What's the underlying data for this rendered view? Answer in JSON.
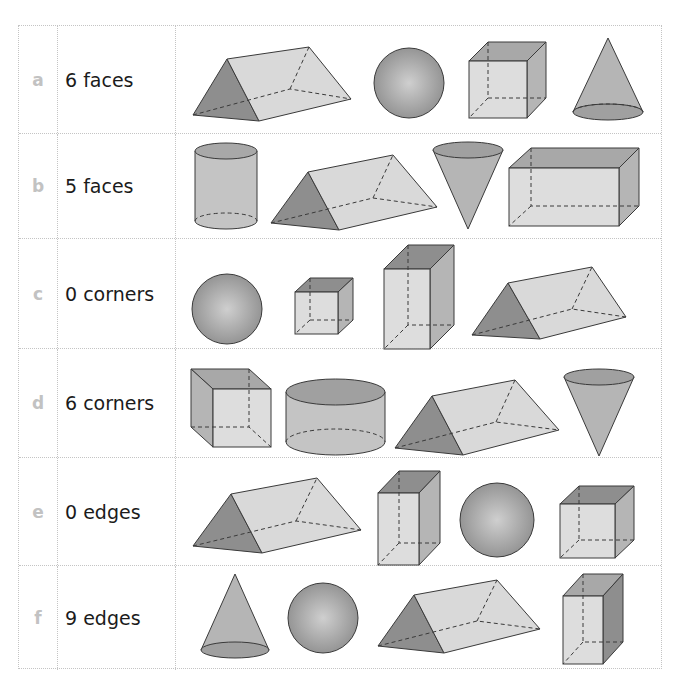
{
  "worksheet": {
    "rows": [
      {
        "letter": "a",
        "label": "6 faces",
        "shapes": [
          "triangular-prism",
          "sphere",
          "cube",
          "cone"
        ]
      },
      {
        "letter": "b",
        "label": "5 faces",
        "shapes": [
          "cylinder",
          "triangular-prism",
          "inverted-cone",
          "cuboid"
        ]
      },
      {
        "letter": "c",
        "label": "0 corners",
        "shapes": [
          "sphere",
          "cube",
          "tall-cuboid",
          "triangular-prism"
        ]
      },
      {
        "letter": "d",
        "label": "6 corners",
        "shapes": [
          "cube",
          "short-cylinder",
          "triangular-prism",
          "inverted-cone"
        ]
      },
      {
        "letter": "e",
        "label": "0 edges",
        "shapes": [
          "triangular-prism",
          "tall-cuboid",
          "sphere",
          "cube"
        ]
      },
      {
        "letter": "f",
        "label": "9 edges",
        "shapes": [
          "cone",
          "sphere",
          "triangular-prism",
          "tall-cuboid"
        ]
      }
    ]
  },
  "colors": {
    "letter": "#c2c2c2",
    "label_text": "#1b1b1b",
    "grid_line": "#c4c4c4",
    "shape_light": "#d9d9d9",
    "shape_mid": "#b5b5b5",
    "shape_dark": "#8e8e8e",
    "shape_stroke": "#3a3a3a"
  }
}
